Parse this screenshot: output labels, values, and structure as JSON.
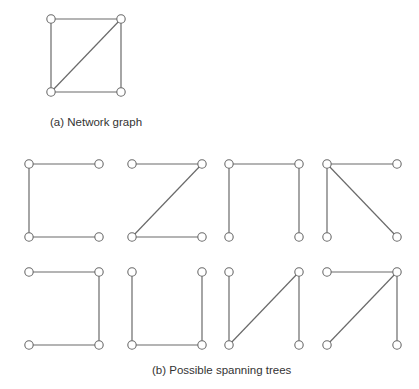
{
  "network_graph": {
    "caption": "(a) Network graph",
    "nodes": [
      {
        "id": "A",
        "x": 51,
        "y": 19
      },
      {
        "id": "B",
        "x": 121,
        "y": 19
      },
      {
        "id": "C",
        "x": 51,
        "y": 92
      },
      {
        "id": "D",
        "x": 121,
        "y": 92
      }
    ],
    "edges": [
      [
        "A",
        "B"
      ],
      [
        "A",
        "C"
      ],
      [
        "B",
        "D"
      ],
      [
        "C",
        "D"
      ],
      [
        "C",
        "B"
      ]
    ]
  },
  "spanning_trees": {
    "caption": "(b) Possible spanning trees",
    "trees": [
      {
        "origin": [
          29,
          164
        ],
        "edges": [
          [
            "TL",
            "TR"
          ],
          [
            "TL",
            "BL"
          ],
          [
            "BL",
            "BR"
          ]
        ]
      },
      {
        "origin": [
          132,
          164
        ],
        "edges": [
          [
            "TL",
            "TR"
          ],
          [
            "TR",
            "BL"
          ],
          [
            "BL",
            "BR"
          ]
        ]
      },
      {
        "origin": [
          229,
          164
        ],
        "edges": [
          [
            "TL",
            "TR"
          ],
          [
            "TL",
            "BL"
          ],
          [
            "TR",
            "BR"
          ]
        ]
      },
      {
        "origin": [
          327,
          164
        ],
        "edges": [
          [
            "TL",
            "TR"
          ],
          [
            "TL",
            "BL"
          ],
          [
            "TL",
            "BR"
          ]
        ]
      },
      {
        "origin": [
          29,
          272
        ],
        "edges": [
          [
            "TL",
            "TR"
          ],
          [
            "TR",
            "BR"
          ],
          [
            "BL",
            "BR"
          ]
        ]
      },
      {
        "origin": [
          132,
          272
        ],
        "edges": [
          [
            "TL",
            "BL"
          ],
          [
            "BL",
            "BR"
          ],
          [
            "TR",
            "BR"
          ]
        ]
      },
      {
        "origin": [
          229,
          272
        ],
        "edges": [
          [
            "TL",
            "BL"
          ],
          [
            "BL",
            "TR"
          ],
          [
            "TR",
            "BR"
          ]
        ]
      },
      {
        "origin": [
          327,
          272
        ],
        "edges": [
          [
            "TL",
            "TR"
          ],
          [
            "TR",
            "BL"
          ],
          [
            "TR",
            "BR"
          ]
        ]
      }
    ],
    "node_spacing": {
      "dx": 70,
      "dy": 73
    }
  },
  "colors": {
    "stroke": "#6a6a6a",
    "text": "#333333"
  }
}
